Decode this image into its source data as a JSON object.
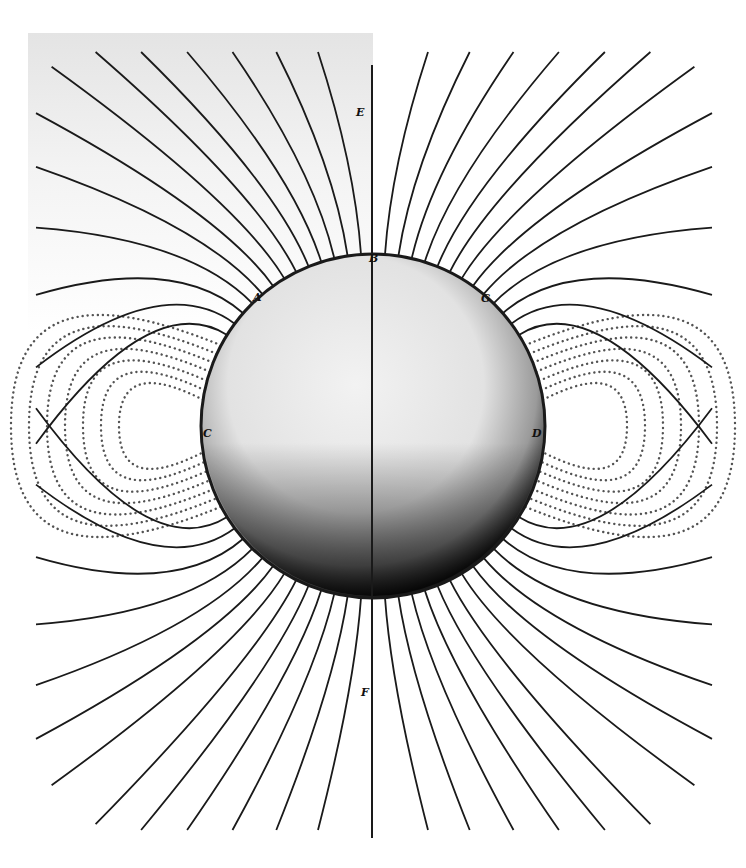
{
  "figure": {
    "width": 746,
    "height": 868,
    "background": "#ffffff",
    "paper_tint": "#e6e6e6",
    "ink": "#1a1a1a",
    "sphere": {
      "cx": 373,
      "cy": 426,
      "r": 172,
      "fill_light": "#eeeeee",
      "fill_mid": "#d8d8d8",
      "shadow": "#111111"
    },
    "axis": {
      "x": 372,
      "y1": 65,
      "y2": 838
    },
    "labels": [
      {
        "id": "E",
        "text": "E",
        "x": 356,
        "y": 116
      },
      {
        "id": "B",
        "text": "B",
        "x": 369,
        "y": 262
      },
      {
        "id": "A",
        "text": "A",
        "x": 253,
        "y": 301
      },
      {
        "id": "G",
        "text": "G",
        "x": 481,
        "y": 302
      },
      {
        "id": "C",
        "text": "C",
        "x": 203,
        "y": 437
      },
      {
        "id": "D",
        "text": "D",
        "x": 532,
        "y": 437
      },
      {
        "id": "F",
        "text": "F",
        "x": 361,
        "y": 696
      }
    ],
    "solid_lines_top": {
      "description": "solid field lines radiating from upper hemisphere",
      "count_per_side": 13,
      "angle_start_deg": 4,
      "angle_end_deg": 58
    },
    "solid_lines_bottom": {
      "description": "solid field lines radiating from lower hemisphere",
      "count_per_side": 13,
      "angle_start_deg": 4,
      "angle_end_deg": 58
    },
    "dotted_arcs": {
      "description": "dotted loops returning between hemispheres on each side",
      "count_per_side": 7
    }
  }
}
